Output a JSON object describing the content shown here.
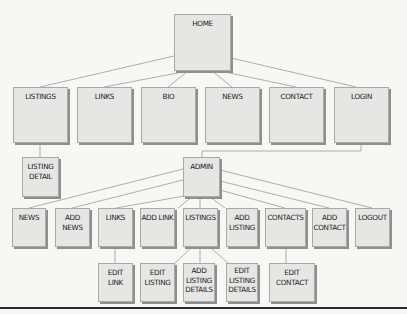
{
  "diagram": {
    "type": "site-map",
    "colors": {
      "box_fill": "#e6e6e4",
      "box_border": "#a9a9a7",
      "shadow": "#8f8f8d",
      "line": "#9a9a98",
      "background": "#f7f7f5"
    },
    "nodes": {
      "home": {
        "label": "HOME",
        "x": 174,
        "y": 14,
        "w": 57,
        "h": 57
      },
      "listings": {
        "label": "LISTINGS",
        "x": 13,
        "y": 87,
        "w": 55,
        "h": 56
      },
      "links": {
        "label": "LINKS",
        "x": 77,
        "y": 87,
        "w": 55,
        "h": 56
      },
      "bio": {
        "label": "BIO",
        "x": 141,
        "y": 87,
        "w": 55,
        "h": 56
      },
      "news": {
        "label": "NEWS",
        "x": 205,
        "y": 87,
        "w": 55,
        "h": 56
      },
      "contact": {
        "label": "CONTACT",
        "x": 269,
        "y": 87,
        "w": 55,
        "h": 56
      },
      "login": {
        "label": "LOGIN",
        "x": 334,
        "y": 87,
        "w": 55,
        "h": 56
      },
      "listing_detail": {
        "label": "LISTING\nDETAIL",
        "x": 22,
        "y": 157,
        "w": 37,
        "h": 40
      },
      "admin": {
        "label": "ADMIN",
        "x": 183,
        "y": 157,
        "w": 37,
        "h": 40
      },
      "admin_news": {
        "label": "NEWS",
        "x": 12,
        "y": 208,
        "w": 34,
        "h": 39
      },
      "add_news": {
        "label": "ADD\nNEWS",
        "x": 55,
        "y": 208,
        "w": 35,
        "h": 39
      },
      "admin_links": {
        "label": "LINKS",
        "x": 98,
        "y": 208,
        "w": 35,
        "h": 39
      },
      "add_link": {
        "label": "ADD LINK",
        "x": 140,
        "y": 208,
        "w": 35,
        "h": 39
      },
      "admin_listings": {
        "label": "LISTINGS",
        "x": 183,
        "y": 208,
        "w": 35,
        "h": 39
      },
      "add_listing": {
        "label": "ADD\nLISTING",
        "x": 226,
        "y": 208,
        "w": 32,
        "h": 39
      },
      "contacts": {
        "label": "CONTACTS",
        "x": 265,
        "y": 208,
        "w": 41,
        "h": 39
      },
      "add_contact": {
        "label": "ADD\nCONTACT",
        "x": 312,
        "y": 208,
        "w": 35,
        "h": 39
      },
      "logout": {
        "label": "LOGOUT",
        "x": 355,
        "y": 208,
        "w": 35,
        "h": 39
      },
      "edit_link": {
        "label": "EDIT\nLINK",
        "x": 98,
        "y": 263,
        "w": 35,
        "h": 39
      },
      "edit_listing": {
        "label": "EDIT\nLISTING",
        "x": 140,
        "y": 263,
        "w": 35,
        "h": 39
      },
      "add_listing_details": {
        "label": "ADD\nLISTING\nDETAILS",
        "x": 183,
        "y": 263,
        "w": 32,
        "h": 39
      },
      "edit_listing_details": {
        "label": "EDIT\nLISTING\nDETAILS",
        "x": 226,
        "y": 263,
        "w": 32,
        "h": 39
      },
      "edit_contact": {
        "label": "EDIT\nCONTACT",
        "x": 269,
        "y": 263,
        "w": 46,
        "h": 39
      }
    },
    "edges": [
      [
        "home",
        "listings"
      ],
      [
        "home",
        "links"
      ],
      [
        "home",
        "bio"
      ],
      [
        "home",
        "news"
      ],
      [
        "home",
        "contact"
      ],
      [
        "home",
        "login"
      ],
      [
        "listings",
        "listing_detail"
      ],
      [
        "login",
        "admin"
      ],
      [
        "admin",
        "admin_news"
      ],
      [
        "admin",
        "add_news"
      ],
      [
        "admin",
        "admin_links"
      ],
      [
        "admin",
        "add_link"
      ],
      [
        "admin",
        "admin_listings"
      ],
      [
        "admin",
        "add_listing"
      ],
      [
        "admin",
        "contacts"
      ],
      [
        "admin",
        "add_contact"
      ],
      [
        "admin",
        "logout"
      ],
      [
        "admin_links",
        "edit_link"
      ],
      [
        "admin_listings",
        "edit_listing"
      ],
      [
        "admin_listings",
        "add_listing_details"
      ],
      [
        "admin_listings",
        "edit_listing_details"
      ],
      [
        "contacts",
        "edit_contact"
      ]
    ]
  }
}
